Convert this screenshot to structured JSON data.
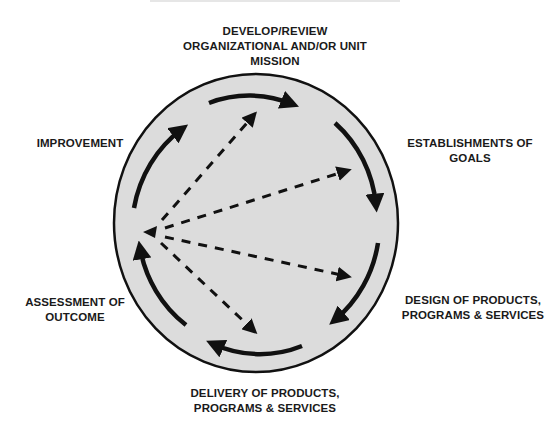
{
  "diagram": {
    "title": "",
    "colors": {
      "circle_fill": "#dcdcdc",
      "stroke": "#111111",
      "background": "#ffffff"
    },
    "nodes": [
      {
        "id": "mission",
        "lines": [
          "DEVELOP/REVIEW",
          "ORGANIZATIONAL AND/OR UNIT",
          "MISSION"
        ]
      },
      {
        "id": "goals",
        "lines": [
          "ESTABLISHMENTS OF",
          "GOALS"
        ]
      },
      {
        "id": "design",
        "lines": [
          "DESIGN OF PRODUCTS,",
          "PROGRAMS & SERVICES"
        ]
      },
      {
        "id": "delivery",
        "lines": [
          "DELIVERY OF PRODUCTS,",
          "PROGRAMS & SERVICES"
        ]
      },
      {
        "id": "assessment",
        "lines": [
          "ASSESSMENT OF",
          "OUTCOME"
        ]
      },
      {
        "id": "improvement",
        "lines": [
          "IMPROVEMENT"
        ]
      }
    ],
    "cycle_order": [
      "mission",
      "goals",
      "design",
      "delivery",
      "assessment",
      "improvement"
    ],
    "feedback_source": "assessment",
    "feedback_targets": [
      "improvement",
      "mission",
      "goals",
      "design",
      "delivery"
    ]
  }
}
